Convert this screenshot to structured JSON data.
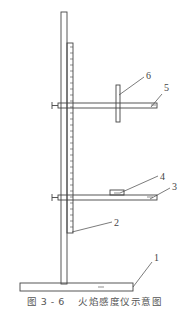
{
  "figure": {
    "caption_number": "图 3 - 6",
    "caption_title": "火焰感度仪示意图"
  },
  "labels": [
    {
      "id": "1",
      "text": "1",
      "x": 154,
      "y": 261,
      "line": [
        133,
        287,
        152,
        262
      ]
    },
    {
      "id": "2",
      "text": "2",
      "x": 114,
      "y": 226,
      "line": [
        72,
        232,
        112,
        222
      ]
    },
    {
      "id": "3",
      "text": "3",
      "x": 172,
      "y": 190,
      "line": [
        150,
        199,
        170,
        188
      ]
    },
    {
      "id": "4",
      "text": "4",
      "x": 160,
      "y": 180,
      "line": [
        120,
        193,
        158,
        176
      ]
    },
    {
      "id": "5",
      "text": "5",
      "x": 164,
      "y": 91,
      "line": [
        151,
        107,
        162,
        94
      ]
    },
    {
      "id": "6",
      "text": "6",
      "x": 146,
      "y": 79,
      "line": [
        119,
        95,
        144,
        77
      ]
    }
  ],
  "colors": {
    "stroke": "#444444",
    "background": "#ffffff"
  }
}
